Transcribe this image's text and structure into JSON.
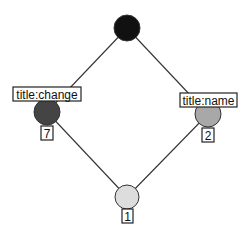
{
  "diagram": {
    "type": "lattice",
    "nodes": [
      {
        "id": "top",
        "cx": 127,
        "cy": 28,
        "r": 13,
        "color": "#111111"
      },
      {
        "id": "left",
        "cx": 47,
        "cy": 112,
        "r": 13,
        "color": "#444444",
        "attribute_label": "title:change",
        "count_label": "7"
      },
      {
        "id": "right",
        "cx": 208,
        "cy": 114,
        "r": 13,
        "color": "#a8a8a8",
        "attribute_label": "title:name",
        "count_label": "2"
      },
      {
        "id": "bottom",
        "cx": 127,
        "cy": 197,
        "r": 12,
        "color": "#dddddd",
        "count_label": "1"
      }
    ],
    "edges": [
      {
        "from": "top",
        "to": "left"
      },
      {
        "from": "top",
        "to": "right"
      },
      {
        "from": "left",
        "to": "bottom"
      },
      {
        "from": "right",
        "to": "bottom"
      }
    ]
  }
}
